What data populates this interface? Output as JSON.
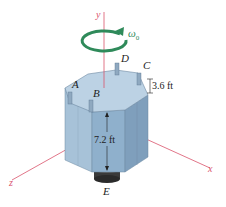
{
  "figure": {
    "axes": {
      "y": "y",
      "x": "x",
      "z": "z"
    },
    "angular_velocity_label": "ω",
    "angular_velocity_subscript": "0",
    "points": {
      "A": "A",
      "B": "B",
      "C": "C",
      "D": "D",
      "E": "E"
    },
    "dimensions": {
      "post_height": "3.6 ft",
      "body_height": "7.2 ft"
    },
    "colors": {
      "axis": "#d9536b",
      "omega_arrow": "#2f8a5a",
      "tank_front": "#8fb0cc",
      "tank_left": "#a7c2d8",
      "tank_right": "#7f9fbc",
      "tank_top": "#bcd2e4",
      "base": "#3a3a3a"
    }
  }
}
